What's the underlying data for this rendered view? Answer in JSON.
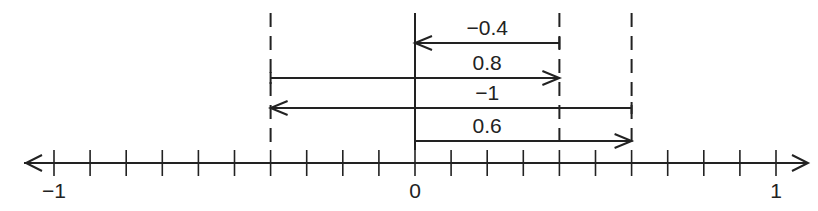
{
  "diagram": {
    "type": "number-line-vector-addition",
    "axis": {
      "min": -1,
      "max": 1,
      "tick_step": 0.1,
      "labels": [
        {
          "value": -1,
          "text": "−1"
        },
        {
          "value": 0,
          "text": "0"
        },
        {
          "value": 1,
          "text": "1"
        }
      ]
    },
    "reference_lines": [
      {
        "value": -0.4,
        "style": "dashed"
      },
      {
        "value": 0,
        "style": "solid"
      },
      {
        "value": 0.4,
        "style": "dashed"
      },
      {
        "value": 0.6,
        "style": "dashed"
      }
    ],
    "arrows": [
      {
        "label": "−0.4",
        "from": 0.4,
        "to": 0
      },
      {
        "label": "0.8",
        "from": -0.4,
        "to": 0.4
      },
      {
        "label": "−1",
        "from": 0.6,
        "to": -0.4
      },
      {
        "label": "0.6",
        "from": 0,
        "to": 0.6
      }
    ],
    "colors": {
      "ink": "#222222",
      "background": "#ffffff"
    }
  }
}
